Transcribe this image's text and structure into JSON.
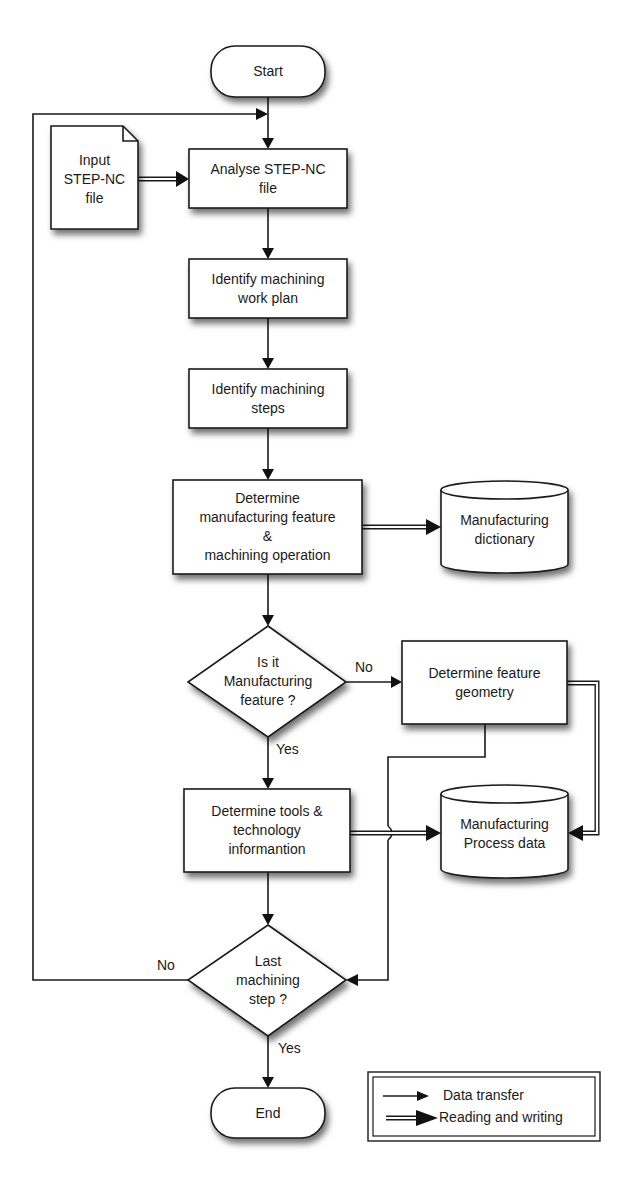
{
  "diagram": {
    "type": "flowchart",
    "nodes": {
      "start": {
        "label": "Start",
        "shape": "terminator"
      },
      "input_file": {
        "label": "Input\nSTEP-NC\nfile",
        "shape": "document"
      },
      "analyse": {
        "label": "Analyse STEP-NC\nfile",
        "shape": "process"
      },
      "work_plan": {
        "label": "Identify machining\nwork plan",
        "shape": "process"
      },
      "steps": {
        "label": "Identify machining\nsteps",
        "shape": "process"
      },
      "mfg_feature": {
        "label": "Determine\nmanufacturing feature\n&\nmachining operation",
        "shape": "process"
      },
      "dictionary": {
        "label": "Manufacturing\ndictionary",
        "shape": "database"
      },
      "decision_feature": {
        "label": "Is it\nManufacturing\nfeature ?",
        "shape": "decision"
      },
      "feature_geometry": {
        "label": "Determine feature\ngeometry",
        "shape": "process"
      },
      "tools": {
        "label": "Determine tools &\ntechnology\ninformantion",
        "shape": "process"
      },
      "process_data": {
        "label": "Manufacturing\nProcess data",
        "shape": "database"
      },
      "decision_last": {
        "label": "Last\nmachining\nstep ?",
        "shape": "decision"
      },
      "end": {
        "label": "End",
        "shape": "terminator"
      }
    },
    "edge_labels": {
      "feature_no": "No",
      "feature_yes": "Yes",
      "last_no": "No",
      "last_yes": "Yes"
    },
    "edges": [
      {
        "from": "start",
        "to": "analyse",
        "kind": "data_transfer"
      },
      {
        "from": "input_file",
        "to": "analyse",
        "kind": "reading_writing"
      },
      {
        "from": "analyse",
        "to": "work_plan",
        "kind": "data_transfer"
      },
      {
        "from": "work_plan",
        "to": "steps",
        "kind": "data_transfer"
      },
      {
        "from": "steps",
        "to": "mfg_feature",
        "kind": "data_transfer"
      },
      {
        "from": "mfg_feature",
        "to": "dictionary",
        "kind": "reading_writing"
      },
      {
        "from": "mfg_feature",
        "to": "decision_feature",
        "kind": "data_transfer"
      },
      {
        "from": "decision_feature",
        "to": "feature_geometry",
        "kind": "data_transfer",
        "label": "No"
      },
      {
        "from": "decision_feature",
        "to": "tools",
        "kind": "data_transfer",
        "label": "Yes"
      },
      {
        "from": "feature_geometry",
        "to": "process_data",
        "kind": "reading_writing"
      },
      {
        "from": "feature_geometry",
        "to": "decision_last",
        "kind": "data_transfer"
      },
      {
        "from": "tools",
        "to": "process_data",
        "kind": "reading_writing"
      },
      {
        "from": "tools",
        "to": "decision_last",
        "kind": "data_transfer"
      },
      {
        "from": "decision_last",
        "to": "analyse",
        "kind": "data_transfer",
        "label": "No"
      },
      {
        "from": "decision_last",
        "to": "end",
        "kind": "data_transfer",
        "label": "Yes"
      }
    ]
  },
  "legend": {
    "data_transfer": "Data transfer",
    "reading_writing": "Reading and writing"
  }
}
